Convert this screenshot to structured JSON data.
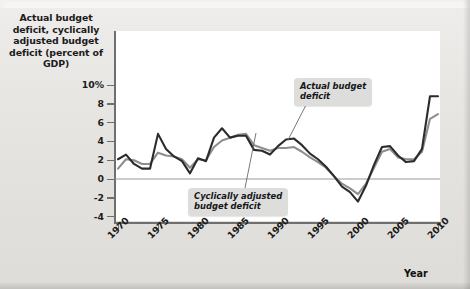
{
  "figure": {
    "y_axis_title": "Actual budget deficit,\ncyclically adjusted\nbudget deficit\n(percent of GDP)",
    "x_axis_title": "Year",
    "callouts": {
      "actual": "Actual budget\ndeficit",
      "cyclical": "Cyclically adjusted\nbudget deficit"
    },
    "colors": {
      "actual_line": "#2b2b2b",
      "cyclical_line": "#8e8e8e",
      "plot_background": "#ffffff",
      "page_background": "#e8e7e4",
      "callout_background": "#dddddc",
      "axis": "#6f6f6f"
    }
  },
  "chart_data": {
    "type": "line",
    "title": "",
    "xlabel": "Year",
    "ylabel": "Actual budget deficit, cyclically adjusted budget deficit (percent of GDP)",
    "xlim": [
      1970,
      2010
    ],
    "ylim": [
      -5,
      11
    ],
    "yticks": [
      "10%",
      "8",
      "6",
      "4",
      "2",
      "0",
      "-2",
      "-4"
    ],
    "ytick_values": [
      10,
      8,
      6,
      4,
      2,
      0,
      -2,
      -4
    ],
    "xticks": [
      "1970",
      "1975",
      "1980",
      "1985",
      "1990",
      "1995",
      "2000",
      "2005",
      "2010"
    ],
    "xtick_values": [
      1970,
      1975,
      1980,
      1985,
      1990,
      1995,
      2000,
      2005,
      2010
    ],
    "grid": false,
    "legend": "annotations",
    "x": [
      1970,
      1971,
      1972,
      1973,
      1974,
      1975,
      1976,
      1977,
      1978,
      1979,
      1980,
      1981,
      1982,
      1983,
      1984,
      1985,
      1986,
      1987,
      1988,
      1989,
      1990,
      1991,
      1992,
      1993,
      1994,
      1995,
      1996,
      1997,
      1998,
      1999,
      2000,
      2001,
      2002,
      2003,
      2004,
      2005,
      2006,
      2007,
      2008,
      2009,
      2010
    ],
    "series": [
      {
        "name": "Actual budget deficit",
        "color": "#2b2b2b",
        "values": [
          2.1,
          2.6,
          1.6,
          1.1,
          1.1,
          4.8,
          3.2,
          2.4,
          1.9,
          0.6,
          2.2,
          1.9,
          4.4,
          5.4,
          4.4,
          4.6,
          4.6,
          3.1,
          3.0,
          2.6,
          3.5,
          4.2,
          4.3,
          3.6,
          2.7,
          2.1,
          1.3,
          0.3,
          -0.8,
          -1.4,
          -2.4,
          -0.7,
          1.5,
          3.4,
          3.5,
          2.5,
          1.8,
          1.9,
          3.2,
          8.8,
          8.8
        ]
      },
      {
        "name": "Cyclically adjusted budget deficit",
        "color": "#8e8e8e",
        "values": [
          1.1,
          2.1,
          2.0,
          1.6,
          1.6,
          2.8,
          2.5,
          2.4,
          2.1,
          1.2,
          2.1,
          2.0,
          3.4,
          4.1,
          4.4,
          4.7,
          4.8,
          3.6,
          3.3,
          3.0,
          3.3,
          3.3,
          3.4,
          2.9,
          2.3,
          1.8,
          1.2,
          0.3,
          -0.5,
          -1.0,
          -1.6,
          -0.5,
          1.2,
          2.9,
          3.2,
          2.3,
          2.1,
          2.1,
          2.9,
          6.4,
          6.9
        ]
      }
    ],
    "annotations": [
      {
        "text": "Actual budget deficit",
        "points_to_year": 1990
      },
      {
        "text": "Cyclically adjusted budget deficit",
        "points_to_year": 1986
      }
    ]
  }
}
